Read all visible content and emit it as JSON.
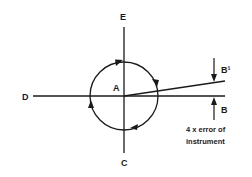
{
  "diagram": {
    "labels": {
      "center": "A",
      "top": "E",
      "bottom": "C",
      "left": "D",
      "right_lower": "B",
      "right_upper": "B¹"
    },
    "annotation": {
      "line1": "4 x error of",
      "line2": "instrument"
    },
    "colors": {
      "stroke": "#1a1a1a",
      "background": "#ffffff"
    }
  }
}
